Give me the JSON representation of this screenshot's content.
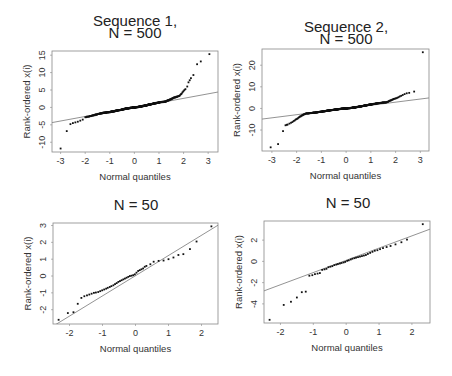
{
  "chart_data": [
    {
      "type": "scatter",
      "subtype": "normal-qq-plot",
      "title": [
        "Sequence 1,",
        "N = 500"
      ],
      "xlabel": "Normal quantiles",
      "ylabel": "Rank-ordered x(i)",
      "xticks": [
        -3,
        -2,
        -1,
        0,
        1,
        2,
        3
      ],
      "yticks": [
        -10,
        -5,
        0,
        5,
        10,
        15
      ],
      "xlim": [
        -3.35,
        3.4
      ],
      "ylim": [
        -12.8,
        16.2
      ],
      "frame": {
        "x": 52,
        "y": 51,
        "w": 166,
        "h": 101
      },
      "title_pos": {
        "x": 135,
        "y1": 26,
        "y2": 38
      },
      "reference_line": {
        "intercept": 0,
        "slope": 1.3
      },
      "n": 500,
      "body": {
        "segments": [
          [
            -2.0,
            -2.8,
            -1.2,
            -1.5,
            0,
            0,
            1.2,
            1.6,
            1.8,
            3.2,
            2.1,
            5.3
          ]
        ]
      },
      "tail_points": [
        [
          -3.0,
          -11.8
        ],
        [
          -2.75,
          -6.8
        ],
        [
          -2.6,
          -4.8
        ],
        [
          -2.5,
          -4.5
        ],
        [
          -2.4,
          -4.3
        ],
        [
          -2.3,
          -4.1
        ],
        [
          -2.2,
          -3.8
        ],
        [
          -2.1,
          -3.5
        ],
        [
          2.15,
          6.0
        ],
        [
          2.2,
          7.2
        ],
        [
          2.25,
          7.8
        ],
        [
          2.3,
          8.4
        ],
        [
          2.4,
          9.3
        ],
        [
          2.55,
          12.4
        ],
        [
          2.7,
          13.2
        ],
        [
          3.05,
          15.3
        ]
      ]
    },
    {
      "type": "scatter",
      "subtype": "normal-qq-plot",
      "title": [
        "Sequence 2,",
        "N = 500"
      ],
      "xlabel": "Normal quantiles",
      "ylabel": "Rank-ordered x(i)",
      "xticks": [
        -3,
        -2,
        -1,
        0,
        1,
        2,
        3
      ],
      "yticks": [
        -10,
        0,
        10,
        20
      ],
      "xlim": [
        -3.4,
        3.35
      ],
      "ylim": [
        -19.7,
        27.5
      ],
      "frame": {
        "x": 262,
        "y": 49,
        "w": 167,
        "h": 102
      },
      "title_pos": {
        "x": 346,
        "y1": 32,
        "y2": 44
      },
      "reference_line": {
        "intercept": 0,
        "slope": 1.45
      },
      "n": 500,
      "body": {
        "segments": [
          [
            -2.4,
            -7.5,
            -1.6,
            -2.3,
            0,
            0,
            1.6,
            2.8,
            2.0,
            4.6,
            2.4,
            6.8
          ]
        ]
      },
      "tail_points": [
        [
          -3.05,
          -18.0
        ],
        [
          -2.75,
          -16.5
        ],
        [
          -2.55,
          -10.5
        ],
        [
          -2.45,
          -7.8
        ],
        [
          -2.4,
          -7.6
        ],
        [
          2.45,
          7.0
        ],
        [
          2.55,
          7.2
        ],
        [
          2.75,
          7.8
        ],
        [
          3.1,
          26.0
        ]
      ]
    },
    {
      "type": "scatter",
      "subtype": "normal-qq-plot",
      "title": [
        "N = 50"
      ],
      "xlabel": "Normal quantiles",
      "ylabel": "Rank-ordered x(i)",
      "xticks": [
        -2,
        -1,
        0,
        1,
        2
      ],
      "yticks": [
        -2,
        -1,
        0,
        1,
        2,
        3
      ],
      "xlim": [
        -2.5,
        2.5
      ],
      "ylim": [
        -2.85,
        3.15
      ],
      "frame": {
        "x": 53,
        "y": 223,
        "w": 165,
        "h": 101
      },
      "title_pos": {
        "x": 136,
        "y1": 210
      },
      "reference_line": {
        "intercept": 0.02,
        "slope": 1.2
      },
      "n": 50,
      "points": [
        [
          -2.33,
          -2.6
        ],
        [
          -2.05,
          -2.2
        ],
        [
          -1.88,
          -2.15
        ],
        [
          -1.75,
          -1.65
        ],
        [
          -1.64,
          -1.3
        ],
        [
          -1.55,
          -1.2
        ],
        [
          -1.47,
          -1.15
        ],
        [
          -1.4,
          -1.1
        ],
        [
          -1.33,
          -1.05
        ],
        [
          -1.26,
          -1.0
        ],
        [
          -1.2,
          -0.98
        ],
        [
          -1.13,
          -0.95
        ],
        [
          -1.07,
          -0.9
        ],
        [
          -1.01,
          -0.85
        ],
        [
          -0.95,
          -0.8
        ],
        [
          -0.89,
          -0.75
        ],
        [
          -0.84,
          -0.7
        ],
        [
          -0.78,
          -0.65
        ],
        [
          -0.73,
          -0.6
        ],
        [
          -0.67,
          -0.55
        ],
        [
          -0.62,
          -0.48
        ],
        [
          -0.57,
          -0.42
        ],
        [
          -0.52,
          -0.35
        ],
        [
          -0.47,
          -0.3
        ],
        [
          -0.42,
          -0.25
        ],
        [
          -0.37,
          -0.2
        ],
        [
          -0.32,
          -0.15
        ],
        [
          -0.27,
          -0.1
        ],
        [
          -0.22,
          -0.05
        ],
        [
          -0.17,
          0.0
        ],
        [
          -0.12,
          0.02
        ],
        [
          -0.07,
          0.05
        ],
        [
          -0.02,
          0.1
        ],
        [
          0.03,
          0.2
        ],
        [
          0.08,
          0.3
        ],
        [
          0.13,
          0.35
        ],
        [
          0.18,
          0.4
        ],
        [
          0.23,
          0.45
        ],
        [
          0.28,
          0.55
        ],
        [
          0.33,
          0.6
        ],
        [
          0.45,
          0.7
        ],
        [
          0.55,
          0.85
        ],
        [
          0.7,
          0.9
        ],
        [
          0.85,
          0.92
        ],
        [
          1.0,
          1.0
        ],
        [
          1.15,
          1.1
        ],
        [
          1.3,
          1.25
        ],
        [
          1.45,
          1.3
        ],
        [
          1.65,
          1.6
        ],
        [
          1.85,
          2.05
        ],
        [
          2.3,
          2.95
        ]
      ]
    },
    {
      "type": "scatter",
      "subtype": "normal-qq-plot",
      "title": [
        "N = 50"
      ],
      "xlabel": "Normal quantiles",
      "ylabel": "Rank-ordered x(i)",
      "xticks": [
        -2,
        -1,
        0,
        1,
        2
      ],
      "yticks": [
        -4,
        -2,
        0,
        2
      ],
      "xlim": [
        -2.5,
        2.55
      ],
      "ylim": [
        -5.8,
        3.8
      ],
      "frame": {
        "x": 264,
        "y": 221,
        "w": 166,
        "h": 102
      },
      "title_pos": {
        "x": 348,
        "y1": 208
      },
      "reference_line": {
        "intercept": 0.1,
        "slope": 1.15
      },
      "n": 50,
      "points": [
        [
          -2.33,
          -5.5
        ],
        [
          -1.9,
          -4.1
        ],
        [
          -1.68,
          -3.8
        ],
        [
          -1.5,
          -3.4
        ],
        [
          -1.35,
          -2.9
        ],
        [
          -1.23,
          -2.85
        ],
        [
          -1.12,
          -1.35
        ],
        [
          -1.03,
          -1.3
        ],
        [
          -0.95,
          -1.2
        ],
        [
          -0.87,
          -1.15
        ],
        [
          -0.8,
          -1.1
        ],
        [
          -0.73,
          -0.8
        ],
        [
          -0.66,
          -0.75
        ],
        [
          -0.6,
          -0.7
        ],
        [
          -0.54,
          -0.55
        ],
        [
          -0.48,
          -0.5
        ],
        [
          -0.42,
          -0.45
        ],
        [
          -0.36,
          -0.35
        ],
        [
          -0.3,
          -0.3
        ],
        [
          -0.25,
          -0.25
        ],
        [
          -0.19,
          -0.2
        ],
        [
          -0.14,
          -0.15
        ],
        [
          -0.08,
          -0.1
        ],
        [
          -0.03,
          -0.05
        ],
        [
          0.03,
          0.05
        ],
        [
          0.08,
          0.1
        ],
        [
          0.14,
          0.18
        ],
        [
          0.19,
          0.25
        ],
        [
          0.25,
          0.3
        ],
        [
          0.3,
          0.35
        ],
        [
          0.36,
          0.4
        ],
        [
          0.42,
          0.45
        ],
        [
          0.48,
          0.5
        ],
        [
          0.54,
          0.55
        ],
        [
          0.6,
          0.6
        ],
        [
          0.66,
          0.7
        ],
        [
          0.73,
          0.8
        ],
        [
          0.8,
          0.9
        ],
        [
          0.87,
          1.0
        ],
        [
          0.95,
          1.05
        ],
        [
          1.03,
          1.15
        ],
        [
          1.12,
          1.25
        ],
        [
          1.23,
          1.35
        ],
        [
          1.35,
          1.45
        ],
        [
          1.5,
          1.6
        ],
        [
          1.68,
          1.8
        ],
        [
          1.85,
          2.05
        ],
        [
          2.33,
          3.5
        ]
      ]
    }
  ]
}
